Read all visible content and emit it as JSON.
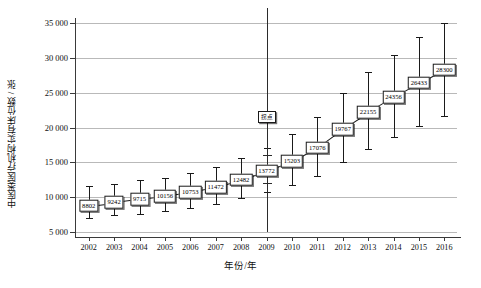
{
  "chart_data": {
    "type": "line",
    "title": "",
    "xlabel": "年份/年",
    "ylabel": "中医类医疗机构实有床位数 / 张",
    "ylim": [
      5000,
      35000
    ],
    "ytick_labels": [
      "35 000",
      "30 000",
      "25 000",
      "20 000",
      "15 000",
      "10 000",
      "5 000"
    ],
    "ytick_values": [
      35000,
      30000,
      25000,
      20000,
      15000,
      10000,
      5000
    ],
    "grid": true,
    "legend": "none",
    "categories": [
      "2002",
      "2003",
      "2004",
      "2005",
      "2006",
      "2007",
      "2008",
      "2009",
      "2010",
      "2011",
      "2012",
      "2013",
      "2014",
      "2015",
      "2016"
    ],
    "values": [
      8802,
      9242,
      9715,
      10156,
      10753,
      11472,
      12482,
      13772,
      15203,
      17076,
      19767,
      22155,
      24356,
      26433,
      28300
    ],
    "error_low": [
      6950,
      7400,
      7600,
      7950,
      8450,
      9050,
      9850,
      10750,
      11750,
      13100,
      15050,
      16900,
      18700,
      20250,
      21600
    ],
    "error_high": [
      11600,
      11900,
      12400,
      12800,
      13500,
      14400,
      15600,
      17100,
      19000,
      21500,
      24900,
      27900,
      30400,
      33000,
      35000
    ],
    "annotations": [
      {
        "name": "turning-point",
        "label": "拐点",
        "x_category": "2009",
        "y_value": 21500,
        "vline": true,
        "vline_top": 35400,
        "vline_bottom": 5000
      }
    ]
  }
}
